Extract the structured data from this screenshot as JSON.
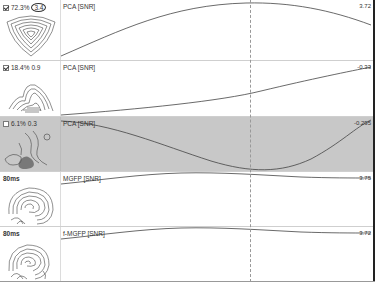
{
  "rows": [
    {
      "checkbox": true,
      "percent": "72.3%",
      "value": "3.4",
      "value_circled": true,
      "label": "PCA [SNR]",
      "end_value": "3.72",
      "selected": false
    },
    {
      "checkbox": true,
      "percent": "18.4%",
      "value": "0.9",
      "value_circled": false,
      "label": "PCA [SNR]",
      "end_value": "-0.33",
      "selected": false
    },
    {
      "checkbox": false,
      "percent": "6.1%",
      "value": "0.3",
      "value_circled": false,
      "label": "PCA [SNR]",
      "end_value": "-0.295",
      "selected": true
    },
    {
      "time": "80ms",
      "label": "MGFP [SNR]",
      "end_value": "3.75",
      "selected": false
    },
    {
      "time": "80ms",
      "label": "f-MGFP [SNR]",
      "end_value": "3.72",
      "selected": false
    }
  ],
  "cursor": {
    "x_fraction": 0.6
  },
  "colors": {
    "selected_row_bg": "#c8c8c8",
    "trace": "#444444",
    "cursor": "#999999"
  }
}
